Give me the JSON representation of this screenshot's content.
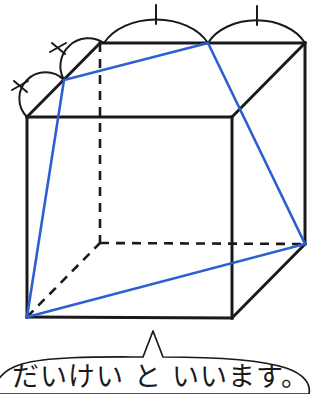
{
  "figure": {
    "colors": {
      "solid_edge": "#1a1a1a",
      "hidden_edge": "#1a1a1a",
      "cross_section": "#2c5fd0",
      "background": "#ffffff",
      "bubble_stroke": "#1a1a1a"
    },
    "cube": {
      "front_top_left": [
        27,
        117
      ],
      "front_top_right": [
        232,
        117
      ],
      "front_bottom_left": [
        27,
        317
      ],
      "front_bottom_right": [
        232,
        318
      ],
      "back_top_left": [
        100,
        43
      ],
      "back_top_right": [
        305,
        43
      ],
      "back_bottom_left": [
        100,
        243
      ],
      "back_bottom_right": [
        305,
        244
      ]
    },
    "top_edge_divisions": {
      "points": [
        [
          64,
          80
        ],
        [
          104,
          43
        ],
        [
          208,
          43
        ]
      ],
      "arc_count": 4,
      "tick_marks": [
        "slash",
        "slash",
        "vertical",
        "vertical"
      ]
    },
    "cross_section_vertices": [
      [
        27,
        317
      ],
      [
        64,
        80
      ],
      [
        208,
        43
      ],
      [
        305,
        244
      ]
    ]
  },
  "caption": {
    "text": "だいけい と いいます。",
    "bubble": "rounded-speech-bubble-with-pointer"
  }
}
